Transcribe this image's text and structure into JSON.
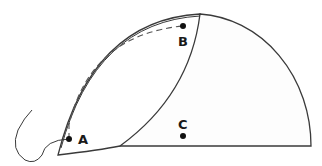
{
  "diagram": {
    "points": [
      {
        "id": "A",
        "label": "A",
        "x": 69,
        "y": 139
      },
      {
        "id": "B",
        "label": "B",
        "x": 183,
        "y": 26
      },
      {
        "id": "C",
        "label": "C",
        "x": 183,
        "y": 136
      }
    ],
    "colors": {
      "stroke": "#3a3a3a",
      "fill": "#fdfdfd",
      "dash": "#555555",
      "dot": "#111111"
    }
  }
}
